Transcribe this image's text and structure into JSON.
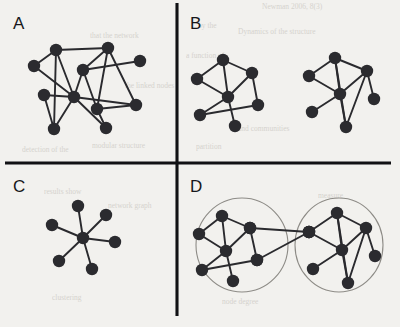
{
  "figure": {
    "background_color": "#f2f1ee",
    "ink_color": "#2b2b2f",
    "divider_color": "#111114",
    "ring_color": "#8d8b86",
    "width": 400,
    "height": 327,
    "node_radius": 6.2,
    "dividers": {
      "vertical": {
        "x": 177,
        "y1": 3,
        "y2": 316,
        "width": 3.1
      },
      "horizontal": {
        "y": 163,
        "x1": 5,
        "x2": 391,
        "width": 3.1
      }
    }
  },
  "panels": [
    {
      "id": "A",
      "label": "A",
      "label_x": 13,
      "label_y": 29,
      "caption": "single dense network, no visible community split",
      "graphs": [
        {
          "name": "graph-a",
          "node_count": 11,
          "edge_count": 18,
          "nodes": [
            {
              "id": 0,
              "x": 56,
              "y": 50
            },
            {
              "id": 1,
              "x": 108,
              "y": 48
            },
            {
              "id": 2,
              "x": 140,
              "y": 61
            },
            {
              "id": 3,
              "x": 34,
              "y": 66
            },
            {
              "id": 4,
              "x": 83,
              "y": 70
            },
            {
              "id": 5,
              "x": 44,
              "y": 95
            },
            {
              "id": 6,
              "x": 74,
              "y": 97
            },
            {
              "id": 7,
              "x": 97,
              "y": 109
            },
            {
              "id": 8,
              "x": 136,
              "y": 105
            },
            {
              "id": 9,
              "x": 54,
              "y": 129
            },
            {
              "id": 10,
              "x": 106,
              "y": 128
            }
          ],
          "edges": [
            [
              0,
              1
            ],
            [
              0,
              3
            ],
            [
              0,
              6
            ],
            [
              0,
              9
            ],
            [
              1,
              4
            ],
            [
              1,
              7
            ],
            [
              1,
              8
            ],
            [
              2,
              4
            ],
            [
              3,
              6
            ],
            [
              4,
              6
            ],
            [
              4,
              7
            ],
            [
              5,
              6
            ],
            [
              5,
              9
            ],
            [
              6,
              9
            ],
            [
              6,
              10
            ],
            [
              6,
              8
            ],
            [
              7,
              8
            ],
            [
              7,
              10
            ]
          ]
        }
      ]
    },
    {
      "id": "B",
      "label": "B",
      "label_x": 190,
      "label_y": 29,
      "caption": "two separate networks drawn apart, no linking edges",
      "graphs": [
        {
          "name": "graph-b-left",
          "node_count": 7,
          "edge_count": 9,
          "nodes": [
            {
              "id": 0,
              "x": 223,
              "y": 60
            },
            {
              "id": 1,
              "x": 252,
              "y": 73
            },
            {
              "id": 2,
              "x": 197,
              "y": 79
            },
            {
              "id": 3,
              "x": 228,
              "y": 97
            },
            {
              "id": 4,
              "x": 258,
              "y": 105
            },
            {
              "id": 5,
              "x": 200,
              "y": 115
            },
            {
              "id": 6,
              "x": 235,
              "y": 126
            }
          ],
          "edges": [
            [
              0,
              1
            ],
            [
              0,
              2
            ],
            [
              0,
              3
            ],
            [
              1,
              3
            ],
            [
              1,
              4
            ],
            [
              2,
              3
            ],
            [
              3,
              5
            ],
            [
              3,
              6
            ],
            [
              4,
              5
            ]
          ]
        },
        {
          "name": "graph-b-right",
          "node_count": 7,
          "edge_count": 10,
          "nodes": [
            {
              "id": 0,
              "x": 335,
              "y": 58
            },
            {
              "id": 1,
              "x": 367,
              "y": 71
            },
            {
              "id": 2,
              "x": 309,
              "y": 76
            },
            {
              "id": 3,
              "x": 340,
              "y": 94
            },
            {
              "id": 4,
              "x": 374,
              "y": 99
            },
            {
              "id": 5,
              "x": 312,
              "y": 112
            },
            {
              "id": 6,
              "x": 346,
              "y": 127
            }
          ],
          "edges": [
            [
              0,
              1
            ],
            [
              0,
              2
            ],
            [
              0,
              3
            ],
            [
              0,
              6
            ],
            [
              1,
              3
            ],
            [
              1,
              4
            ],
            [
              1,
              6
            ],
            [
              2,
              3
            ],
            [
              3,
              5
            ],
            [
              3,
              6
            ]
          ]
        }
      ]
    },
    {
      "id": "C",
      "label": "C",
      "label_x": 13,
      "label_y": 192,
      "caption": "star network: one hub linked to six peripheral nodes",
      "graphs": [
        {
          "name": "graph-c-star",
          "node_count": 7,
          "edge_count": 6,
          "nodes": [
            {
              "id": 0,
              "x": 83,
              "y": 238
            },
            {
              "id": 1,
              "x": 78,
              "y": 206
            },
            {
              "id": 2,
              "x": 106,
              "y": 215
            },
            {
              "id": 3,
              "x": 115,
              "y": 242
            },
            {
              "id": 4,
              "x": 92,
              "y": 269
            },
            {
              "id": 5,
              "x": 59,
              "y": 261
            },
            {
              "id": 6,
              "x": 52,
              "y": 225
            }
          ],
          "edges": [
            [
              0,
              1
            ],
            [
              0,
              2
            ],
            [
              0,
              3
            ],
            [
              0,
              4
            ],
            [
              0,
              5
            ],
            [
              0,
              6
            ]
          ]
        }
      ]
    },
    {
      "id": "D",
      "label": "D",
      "label_x": 190,
      "label_y": 192,
      "caption": "two communities circled and joined by two bridging edges",
      "communities": [
        {
          "name": "community-left",
          "cx": 242,
          "cy": 245,
          "rx": 46,
          "ry": 47
        },
        {
          "name": "community-right",
          "cx": 339,
          "cy": 245,
          "rx": 44,
          "ry": 47
        }
      ],
      "graphs": [
        {
          "name": "graph-d-left",
          "node_count": 7,
          "edge_count": 9,
          "nodes": [
            {
              "id": 0,
              "x": 222,
              "y": 216
            },
            {
              "id": 1,
              "x": 250,
              "y": 228
            },
            {
              "id": 2,
              "x": 199,
              "y": 234
            },
            {
              "id": 3,
              "x": 226,
              "y": 251
            },
            {
              "id": 4,
              "x": 257,
              "y": 260
            },
            {
              "id": 5,
              "x": 202,
              "y": 270
            },
            {
              "id": 6,
              "x": 233,
              "y": 281
            }
          ],
          "edges": [
            [
              0,
              1
            ],
            [
              0,
              2
            ],
            [
              0,
              3
            ],
            [
              1,
              3
            ],
            [
              1,
              4
            ],
            [
              2,
              3
            ],
            [
              3,
              5
            ],
            [
              3,
              6
            ],
            [
              4,
              5
            ]
          ]
        },
        {
          "name": "graph-d-right",
          "node_count": 7,
          "edge_count": 10,
          "nodes": [
            {
              "id": 0,
              "x": 337,
              "y": 213
            },
            {
              "id": 1,
              "x": 366,
              "y": 228
            },
            {
              "id": 2,
              "x": 309,
              "y": 232
            },
            {
              "id": 3,
              "x": 342,
              "y": 250
            },
            {
              "id": 4,
              "x": 375,
              "y": 256
            },
            {
              "id": 5,
              "x": 313,
              "y": 269
            },
            {
              "id": 6,
              "x": 348,
              "y": 283
            }
          ],
          "edges": [
            [
              0,
              1
            ],
            [
              0,
              2
            ],
            [
              0,
              3
            ],
            [
              0,
              6
            ],
            [
              1,
              3
            ],
            [
              1,
              4
            ],
            [
              1,
              6
            ],
            [
              2,
              3
            ],
            [
              3,
              5
            ],
            [
              3,
              6
            ]
          ]
        }
      ],
      "bridges": [
        {
          "from_graph": "graph-d-left",
          "from_node": 1,
          "to_graph": "graph-d-right",
          "to_node": 2
        },
        {
          "from_graph": "graph-d-left",
          "from_node": 4,
          "to_graph": "graph-d-right",
          "to_node": 2
        }
      ]
    }
  ],
  "bleed_through_text": [
    {
      "text": "Newman 2006, 8(3)",
      "x": 262,
      "y": 9,
      "rotate": 0
    },
    {
      "text": "Dynamics of the structure",
      "x": 238,
      "y": 34,
      "rotate": 0
    },
    {
      "text": "by the",
      "x": 198,
      "y": 28,
      "rotate": 0
    },
    {
      "text": "a function of",
      "x": 186,
      "y": 58,
      "rotate": 0
    },
    {
      "text": "that the network",
      "x": 90,
      "y": 38,
      "rotate": 0
    },
    {
      "text": "the linked nodes",
      "x": 125,
      "y": 88,
      "rotate": 0
    },
    {
      "text": "modular structure",
      "x": 92,
      "y": 148,
      "rotate": 0
    },
    {
      "text": "detection of the",
      "x": 22,
      "y": 152,
      "rotate": 0
    },
    {
      "text": "and communities",
      "x": 238,
      "y": 131,
      "rotate": 0
    },
    {
      "text": "partition",
      "x": 196,
      "y": 149,
      "rotate": 0
    },
    {
      "text": "results show",
      "x": 44,
      "y": 194,
      "rotate": 0
    },
    {
      "text": "network graph",
      "x": 108,
      "y": 208,
      "rotate": 0
    },
    {
      "text": "node degree",
      "x": 222,
      "y": 304,
      "rotate": 0
    },
    {
      "text": "clustering",
      "x": 52,
      "y": 300,
      "rotate": 0
    },
    {
      "text": "measure",
      "x": 318,
      "y": 198,
      "rotate": 0
    }
  ]
}
